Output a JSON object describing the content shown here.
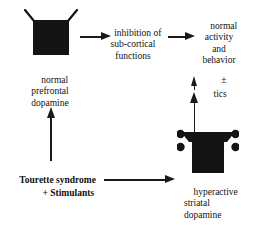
{
  "diagram": {
    "background_color": "#ffffff",
    "ink_color": "#1a1a1a",
    "nodes": {
      "prefrontal_label": "normal\nprefrontal\ndopamine",
      "inhibition_label": "inhibition of\nsub-cortical\nfunctions",
      "outcome_label": "normal\nactivity\nand\nbehavior",
      "outcome_modifier": "±",
      "outcome_tics": "tics",
      "cause_label_line1": "Tourette syndrome",
      "cause_label_line2": "+ Stimulants",
      "striatal_label": "hyperactive\nstriatal\ndopamine"
    },
    "shapes": {
      "prefrontal_neuron": "open-terminal-with-two-antennae",
      "striatal_neuron": "flared-terminal-with-four-dopamine-dots",
      "dopamine_dot_count": 4
    },
    "arrows": [
      {
        "name": "prefrontal-to-inhibition",
        "direction": "right"
      },
      {
        "name": "inhibition-to-outcome",
        "direction": "right"
      },
      {
        "name": "cause-to-prefrontal",
        "direction": "up"
      },
      {
        "name": "cause-to-striatal",
        "direction": "right"
      },
      {
        "name": "striatal-to-outcome",
        "direction": "up"
      },
      {
        "name": "tics-indicator",
        "direction": "up"
      }
    ]
  }
}
